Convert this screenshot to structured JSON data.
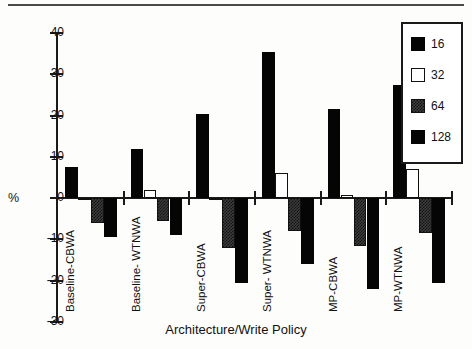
{
  "figure": {
    "top_rule": true
  },
  "chart_data": {
    "type": "bar",
    "title": "",
    "xlabel": "Architecture/Write Policy",
    "ylabel": "%",
    "ylim": [
      -30,
      40
    ],
    "yticks": [
      40,
      30,
      20,
      10,
      0,
      -10,
      -20,
      -30
    ],
    "ytick_labels": [
      "40",
      "30",
      "20",
      "10",
      "0",
      "-10",
      "-20",
      "-30"
    ],
    "grid": false,
    "legend_position": "upper-right",
    "categories": [
      "Baseline-CBWA",
      "Baseline- WTNWA",
      "Super-CBWA",
      "Super- WTNWA",
      "MP-CBWA",
      "MP-WTNWA"
    ],
    "series": [
      {
        "name": "16",
        "color": "#050505",
        "fill": "solid",
        "values": [
          7.5,
          12.0,
          20.5,
          35.5,
          21.5,
          27.5
        ]
      },
      {
        "name": "32",
        "color": "#ffffff",
        "fill": "empty",
        "values": [
          -0.5,
          2.0,
          -0.5,
          6.0,
          0.7,
          7.0
        ]
      },
      {
        "name": "64",
        "color": "#3d3d3d",
        "fill": "hatched",
        "values": [
          -6.0,
          -5.5,
          -12.0,
          -8.0,
          -11.5,
          -8.5
        ]
      },
      {
        "name": "128",
        "color": "#050505",
        "fill": "solid",
        "values": [
          -9.5,
          -9.0,
          -20.5,
          -16.0,
          -22.0,
          -20.5
        ]
      }
    ]
  },
  "legend": {
    "items": [
      {
        "label": "16"
      },
      {
        "label": "32"
      },
      {
        "label": "64"
      },
      {
        "label": "128"
      }
    ]
  }
}
